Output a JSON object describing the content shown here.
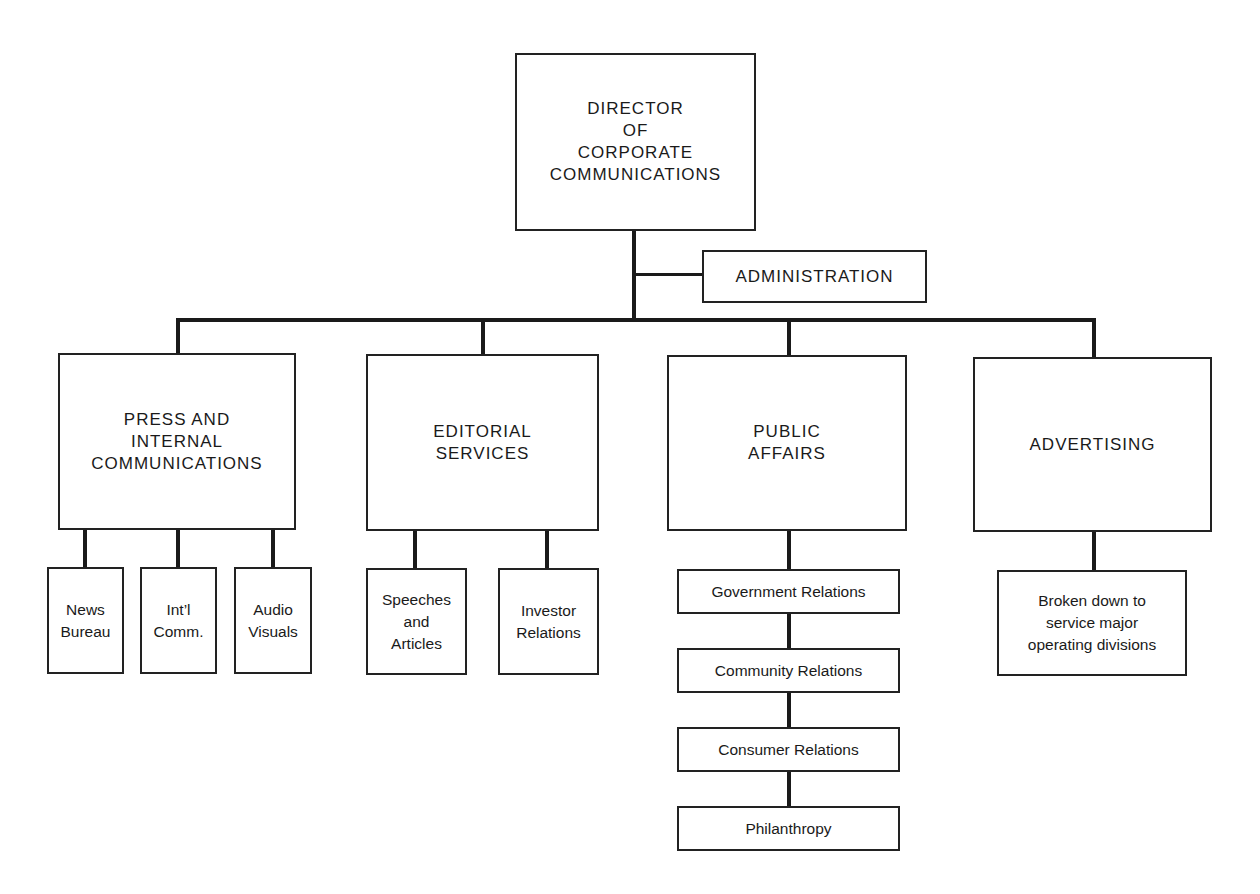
{
  "chart": {
    "root": {
      "label": "DIRECTOR\nOF\nCORPORATE\nCOMMUNICATIONS"
    },
    "staff": {
      "label": "ADMINISTRATION"
    },
    "departments": [
      {
        "label": "PRESS AND\nINTERNAL\nCOMMUNICATIONS",
        "children": [
          {
            "label": "News\nBureau"
          },
          {
            "label": "Int’l\nComm."
          },
          {
            "label": "Audio\nVisuals"
          }
        ]
      },
      {
        "label": "EDITORIAL\nSERVICES",
        "children": [
          {
            "label": "Speeches\nand\nArticles"
          },
          {
            "label": "Investor\nRelations"
          }
        ]
      },
      {
        "label": "PUBLIC\nAFFAIRS",
        "children": [
          {
            "label": "Government Relations"
          },
          {
            "label": "Community Relations"
          },
          {
            "label": "Consumer Relations"
          },
          {
            "label": "Philanthropy"
          }
        ]
      },
      {
        "label": "ADVERTISING",
        "children": [
          {
            "label": "Broken down to\nservice major\noperating divisions"
          }
        ]
      }
    ]
  }
}
